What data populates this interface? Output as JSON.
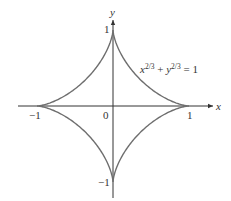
{
  "figure": {
    "equation": {
      "base_x": "x",
      "exp_x": "2/3",
      "plus": "+",
      "base_y": "y",
      "exp_y": "2/3",
      "equals": "= 1"
    },
    "axes": {
      "x_label": "x",
      "y_label": "y",
      "origin_label": "0",
      "x_ticks": [
        "−1",
        "1"
      ],
      "y_ticks": [
        "1",
        "−1"
      ]
    },
    "colors": {
      "curve": "#6e6e6e",
      "axis": "#333333"
    }
  },
  "chart_data": {
    "type": "line",
    "equation": "x^(2/3) + y^(2/3) = 1",
    "xlabel": "x",
    "ylabel": "y",
    "xlim": [
      -1.25,
      1.3
    ],
    "ylim": [
      -1.2,
      1.15
    ],
    "x_ticks": [
      -1,
      0,
      1
    ],
    "y_ticks": [
      -1,
      1
    ],
    "grid": false,
    "series": [
      {
        "name": "astroid",
        "parametric": "x = cos^3 t, y = sin^3 t",
        "cusps": [
          [
            1,
            0
          ],
          [
            0,
            1
          ],
          [
            -1,
            0
          ],
          [
            0,
            -1
          ]
        ]
      }
    ]
  }
}
